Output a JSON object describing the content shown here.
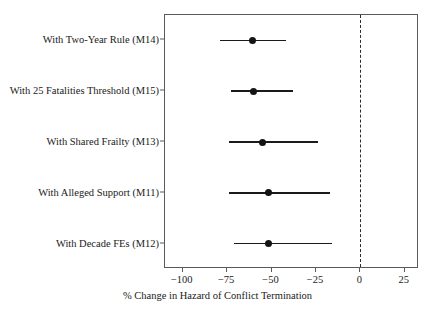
{
  "chart_data": {
    "type": "scatter",
    "subtype": "forest-plot",
    "title": "",
    "subtitle": "",
    "xlabel": "% Change in Hazard of Conflict Termination",
    "ylabel": "",
    "xlim": [
      -110,
      33
    ],
    "xticks": [
      -100,
      -75,
      -50,
      -25,
      0,
      25
    ],
    "xticklabels": [
      "−100",
      "−75",
      "−50",
      "−25",
      "0",
      "25"
    ],
    "grid": false,
    "legend": null,
    "reference_line": {
      "value": 0,
      "style": "dashed",
      "color": "#2b2b2b",
      "orientation": "vertical"
    },
    "categories": [
      "With Two-Year Rule (M14)",
      "With 25 Fatalities Threshold (M15)",
      "With Shared Frailty (M13)",
      "With Alleged Support (M11)",
      "With Decade FEs (M12)"
    ],
    "points": [
      {
        "label": "With Two-Year Rule (M14)",
        "estimate": -61,
        "ci_low": -79,
        "ci_high": -42
      },
      {
        "label": "With 25 Fatalities Threshold (M15)",
        "estimate": -60,
        "ci_low": -73,
        "ci_high": -38
      },
      {
        "label": "With Shared Frailty (M13)",
        "estimate": -55,
        "ci_low": -74,
        "ci_high": -24
      },
      {
        "label": "With Alleged Support (M11)",
        "estimate": -52,
        "ci_low": -74,
        "ci_high": -17
      },
      {
        "label": "With Decade FEs (M12)",
        "estimate": -52,
        "ci_low": -71,
        "ci_high": -16
      }
    ],
    "marker": "filled-circle",
    "marker_color": "#141414",
    "line_color": "#1a1a1a"
  }
}
